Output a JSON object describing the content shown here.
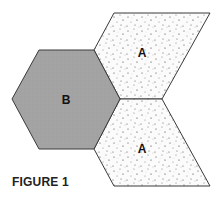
{
  "figure": {
    "caption": "FIGURE 1",
    "colors": {
      "hexagon_fill": "#a3a3a3",
      "rhombus_fill": "#fbfbfb",
      "stroke": "#3a3a3a",
      "dot": "#444444"
    },
    "shapes": [
      {
        "type": "hexagon",
        "label": "B",
        "points": "12,99 39,50 94,50 120,99 94,149 39,149",
        "label_pos": [
          66,
          104
        ]
      },
      {
        "type": "rhombus",
        "label": "A",
        "points": "114,13 210,13 162,99 120,99 94,50",
        "label_pos": [
          142,
          57
        ]
      },
      {
        "type": "rhombus",
        "label": "A",
        "points": "120,99 162,99 210,186 114,186 94,149",
        "label_pos": [
          142,
          153
        ]
      }
    ]
  }
}
